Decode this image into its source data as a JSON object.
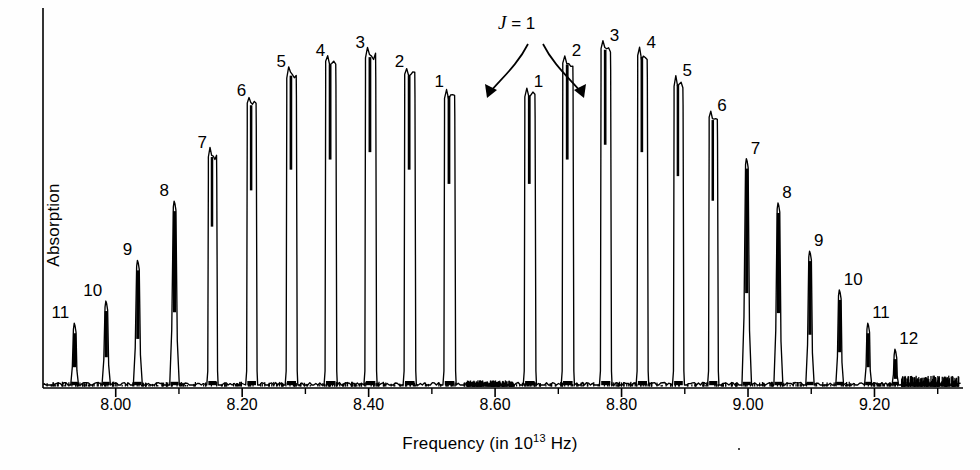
{
  "figure": {
    "type": "spectrum-plot",
    "background": "#ffffff",
    "trace_color": "#000000"
  },
  "axes": {
    "y_title": "Absorption",
    "x_title_prefix": "Frequency (in 10",
    "x_title_sup": "13",
    "x_title_suffix": " Hz)"
  },
  "annotation": {
    "j_equals": "J = 1",
    "italic_j": "J",
    "rest": " = 1"
  },
  "chart_data": {
    "type": "line",
    "title": "",
    "subtitle": "",
    "xlabel": "Frequency (in 10^13 Hz)",
    "ylabel": "Absorption",
    "xlim": [
      7.885,
      9.34
    ],
    "ylim": [
      0,
      1
    ],
    "grid": false,
    "legend": null,
    "axis": {
      "x_ticks_major": [
        "8.00",
        "8.20",
        "8.40",
        "8.60",
        "8.80",
        "9.00",
        "9.20"
      ],
      "x_tick_values": [
        8.0,
        8.2,
        8.4,
        8.6,
        8.8,
        9.0,
        9.2
      ],
      "x_ticks_minor": [
        8.1,
        8.3,
        8.5,
        8.7,
        8.9,
        9.1,
        9.3
      ],
      "y_ticks": []
    },
    "branches": [
      {
        "name": "P-branch",
        "label_side": "left"
      },
      {
        "name": "R-branch",
        "label_side": "right"
      }
    ],
    "peaks": [
      {
        "label": "11",
        "branch": "P",
        "x": 7.935,
        "height": 0.175,
        "width": 0.013
      },
      {
        "label": "10",
        "branch": "P",
        "x": 7.985,
        "height": 0.235,
        "width": 0.014
      },
      {
        "label": "9",
        "branch": "P",
        "x": 8.035,
        "height": 0.345,
        "width": 0.015
      },
      {
        "label": "8",
        "branch": "P",
        "x": 8.093,
        "height": 0.505,
        "width": 0.016
      },
      {
        "label": "7",
        "branch": "P",
        "x": 8.153,
        "height": 0.635,
        "width": 0.018
      },
      {
        "label": "6",
        "branch": "P",
        "x": 8.215,
        "height": 0.775,
        "width": 0.019
      },
      {
        "label": "5",
        "branch": "P",
        "x": 8.278,
        "height": 0.855,
        "width": 0.02
      },
      {
        "label": "4",
        "branch": "P",
        "x": 8.34,
        "height": 0.885,
        "width": 0.021
      },
      {
        "label": "3",
        "branch": "P",
        "x": 8.403,
        "height": 0.905,
        "width": 0.021
      },
      {
        "label": "2",
        "branch": "P",
        "x": 8.465,
        "height": 0.855,
        "width": 0.021
      },
      {
        "label": "1",
        "branch": "P",
        "x": 8.528,
        "height": 0.8,
        "width": 0.021
      },
      {
        "label": "1",
        "branch": "R",
        "x": 8.655,
        "height": 0.8,
        "width": 0.021
      },
      {
        "label": "2",
        "branch": "R",
        "x": 8.715,
        "height": 0.885,
        "width": 0.021
      },
      {
        "label": "3",
        "branch": "R",
        "x": 8.775,
        "height": 0.925,
        "width": 0.02
      },
      {
        "label": "4",
        "branch": "R",
        "x": 8.833,
        "height": 0.905,
        "width": 0.02
      },
      {
        "label": "5",
        "branch": "R",
        "x": 8.89,
        "height": 0.83,
        "width": 0.019
      },
      {
        "label": "6",
        "branch": "R",
        "x": 8.945,
        "height": 0.735,
        "width": 0.018
      },
      {
        "label": "7",
        "branch": "R",
        "x": 8.998,
        "height": 0.62,
        "width": 0.016
      },
      {
        "label": "8",
        "branch": "R",
        "x": 9.048,
        "height": 0.5,
        "width": 0.015
      },
      {
        "label": "9",
        "branch": "R",
        "x": 9.098,
        "height": 0.37,
        "width": 0.014
      },
      {
        "label": "10",
        "branch": "R",
        "x": 9.145,
        "height": 0.265,
        "width": 0.013
      },
      {
        "label": "11",
        "branch": "R",
        "x": 9.19,
        "height": 0.175,
        "width": 0.012
      },
      {
        "label": "12",
        "branch": "R",
        "x": 9.233,
        "height": 0.105,
        "width": 0.011
      }
    ],
    "band_centre_gap": {
      "from": 8.528,
      "to": 8.655,
      "note": "missing Q-branch"
    }
  }
}
